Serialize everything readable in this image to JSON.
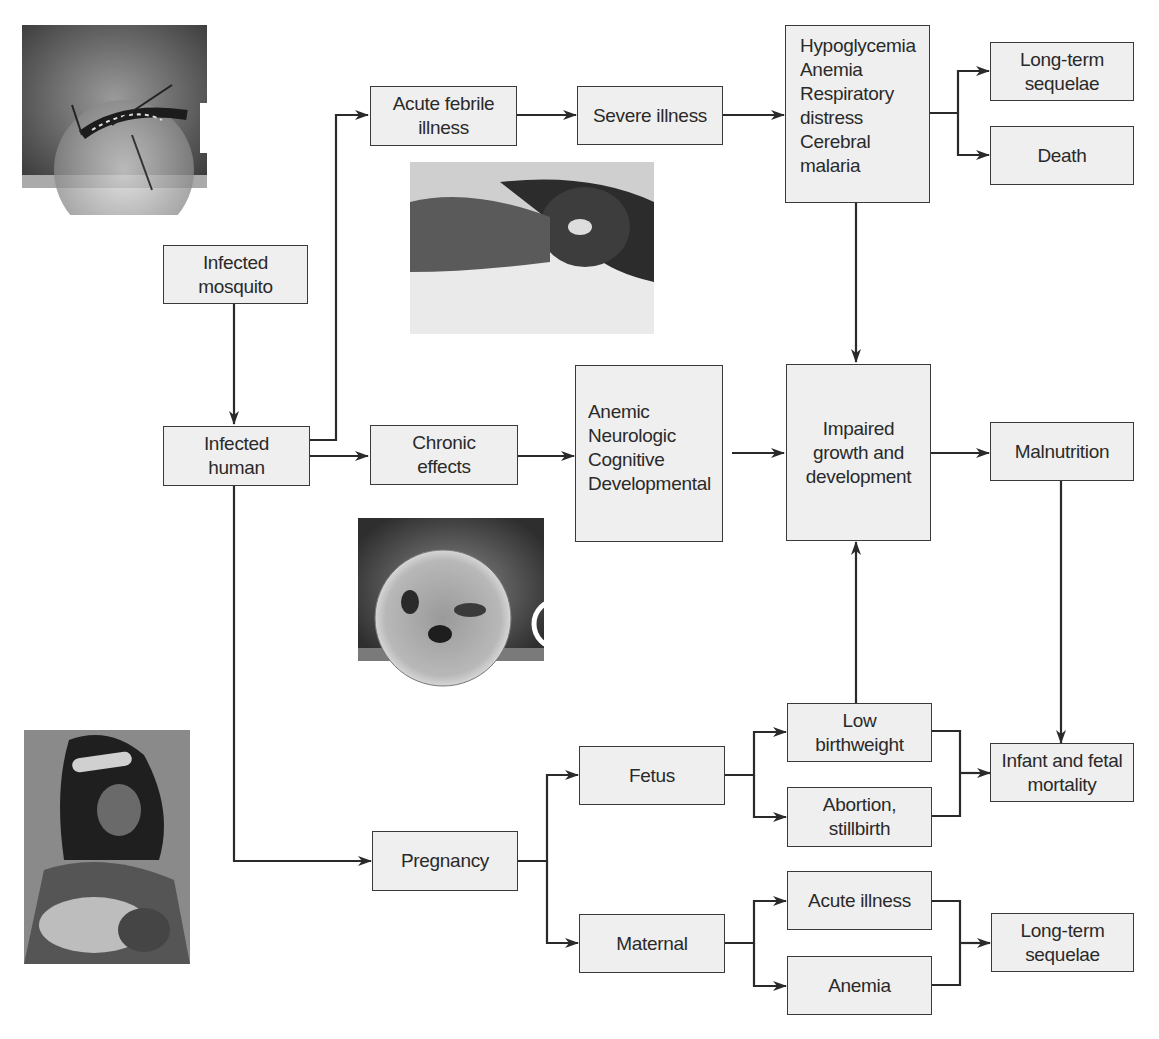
{
  "diagram": {
    "nodes": {
      "infected_mosquito": "Infected\nmosquito",
      "infected_human": "Infected\nhuman",
      "acute_febrile": "Acute febrile\nillness",
      "severe_illness": "Severe illness",
      "severe_effects": "Hypoglycemia\nAnemia\nRespiratory\n  distress\nCerebral\n  malaria",
      "long_term_top": "Long-term\nsequelae",
      "death": "Death",
      "chronic_effects": "Chronic\neffects",
      "chronic_list": "Anemic\nNeurologic\nCognitive\nDevelopmental",
      "impaired_growth": "Impaired\ngrowth and\ndevelopment",
      "malnutrition": "Malnutrition",
      "low_birthweight": "Low\nbirthweight",
      "fetus": "Fetus",
      "abortion": "Abortion,\nstillbirth",
      "infant_mortality": "Infant and fetal\nmortality",
      "pregnancy": "Pregnancy",
      "maternal": "Maternal",
      "acute_illness": "Acute illness",
      "anemia": "Anemia",
      "long_term_bottom": "Long-term\nsequelae"
    },
    "photos": {
      "mosquito_label": "B",
      "parasite_label": "C"
    },
    "colors": {
      "box_fill": "#efefef",
      "line": "#2a2a2a"
    }
  }
}
